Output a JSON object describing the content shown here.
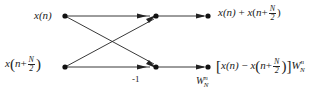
{
  "diagram": {
    "type": "butterfly-flow-graph",
    "inputs": [
      {
        "label": "x(n)"
      },
      {
        "label": "x(n+N/2)"
      }
    ],
    "outputs": [
      {
        "label": "x(n) + x(n+N/2)"
      },
      {
        "label": "[x(n) - x(n+N/2)] W_N^n"
      }
    ],
    "branch_gain_label": "-1",
    "twiddle_label": "W_N^n",
    "twiddle": {
      "W": "W",
      "sub": "N",
      "sup": "n"
    },
    "frac": {
      "num": "N",
      "den": "2"
    },
    "text": {
      "x": "x",
      "n": "n",
      "open": "(",
      "close": ")",
      "plus": "+",
      "minus": "−",
      "lbr": "[",
      "rbr": "]",
      "xn": "x(n)"
    },
    "colors": {
      "line": "#222222",
      "background": "#ffffff"
    }
  }
}
